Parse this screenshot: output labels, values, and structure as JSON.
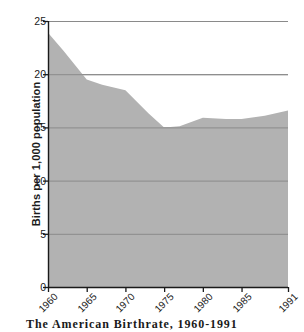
{
  "chart_data": {
    "type": "area",
    "title": "The American Birthrate, 1960-1991",
    "xlabel": "",
    "ylabel": "Births per 1,000 population",
    "x": [
      1960,
      1965,
      1970,
      1975,
      1980,
      1985,
      1991
    ],
    "categories": [
      "1960",
      "1965",
      "1970",
      "1975",
      "1980",
      "1985",
      "1991"
    ],
    "values": [
      23.9,
      19.5,
      18.5,
      15.0,
      15.9,
      15.8,
      16.6
    ],
    "series": [
      {
        "name": "Births per 1,000 population",
        "points": [
          {
            "x": 1960,
            "y": 23.9
          },
          {
            "x": 1962,
            "y": 22.2
          },
          {
            "x": 1965,
            "y": 19.5
          },
          {
            "x": 1967,
            "y": 19.0
          },
          {
            "x": 1970,
            "y": 18.5
          },
          {
            "x": 1973,
            "y": 16.3
          },
          {
            "x": 1975,
            "y": 15.0
          },
          {
            "x": 1977,
            "y": 15.1
          },
          {
            "x": 1980,
            "y": 15.9
          },
          {
            "x": 1983,
            "y": 15.8
          },
          {
            "x": 1985,
            "y": 15.8
          },
          {
            "x": 1988,
            "y": 16.1
          },
          {
            "x": 1991,
            "y": 16.6
          }
        ]
      }
    ],
    "ylim": [
      0,
      25
    ],
    "xlim": [
      1960,
      1991
    ],
    "y_ticks": [
      0,
      5,
      10,
      15,
      20,
      25
    ],
    "y_tick_labels": [
      "0",
      "5",
      "10",
      "15",
      "20",
      "25"
    ],
    "x_ticks": [
      1960,
      1965,
      1970,
      1975,
      1980,
      1985,
      1991
    ],
    "x_tick_labels": [
      "1960",
      "1965",
      "1970",
      "1975",
      "1980",
      "1985",
      "1991"
    ],
    "grid": true,
    "legend": false,
    "legend_position": "none",
    "colors": {
      "area_fill": "#b2b2b2",
      "gridline": "#8a8a8a",
      "axis": "#1a1a1a",
      "background": "#ffffff",
      "text": "#1a1a1a"
    }
  },
  "caption": {
    "text": "The American Birthrate, 1960-1991"
  }
}
